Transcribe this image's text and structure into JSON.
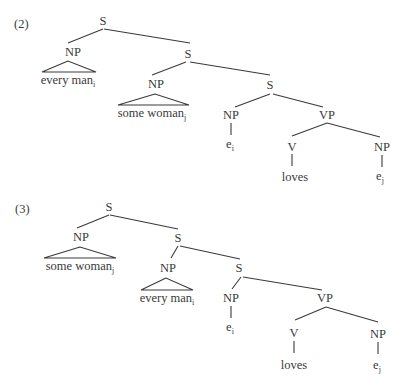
{
  "examples": [
    {
      "number": "(2)",
      "nodes": {
        "s_root": "S",
        "np_1": "NP",
        "np_1_leaf": "every man",
        "np_1_leaf_index": "i",
        "s_2": "S",
        "np_2": "NP",
        "np_2_leaf": "some woman",
        "np_2_leaf_index": "j",
        "s_3": "S",
        "np_3": "NP",
        "np_3_leaf": "e",
        "np_3_leaf_index": "i",
        "vp": "VP",
        "v": "V",
        "v_leaf": "loves",
        "np_obj": "NP",
        "np_obj_leaf": "e",
        "np_obj_leaf_index": "j"
      }
    },
    {
      "number": "(3)",
      "nodes": {
        "s_root": "S",
        "np_1": "NP",
        "np_1_leaf": "some woman",
        "np_1_leaf_index": "j",
        "s_2": "S",
        "np_2": "NP",
        "np_2_leaf": "every man",
        "np_2_leaf_index": "i",
        "s_3": "S",
        "np_3": "NP",
        "np_3_leaf": "e",
        "np_3_leaf_index": "i",
        "vp": "VP",
        "v": "V",
        "v_leaf": "loves",
        "np_obj": "NP",
        "np_obj_leaf": "e",
        "np_obj_leaf_index": "j"
      }
    }
  ],
  "colors": {
    "ink": "#3a3a3a",
    "background": "#ffffff"
  }
}
